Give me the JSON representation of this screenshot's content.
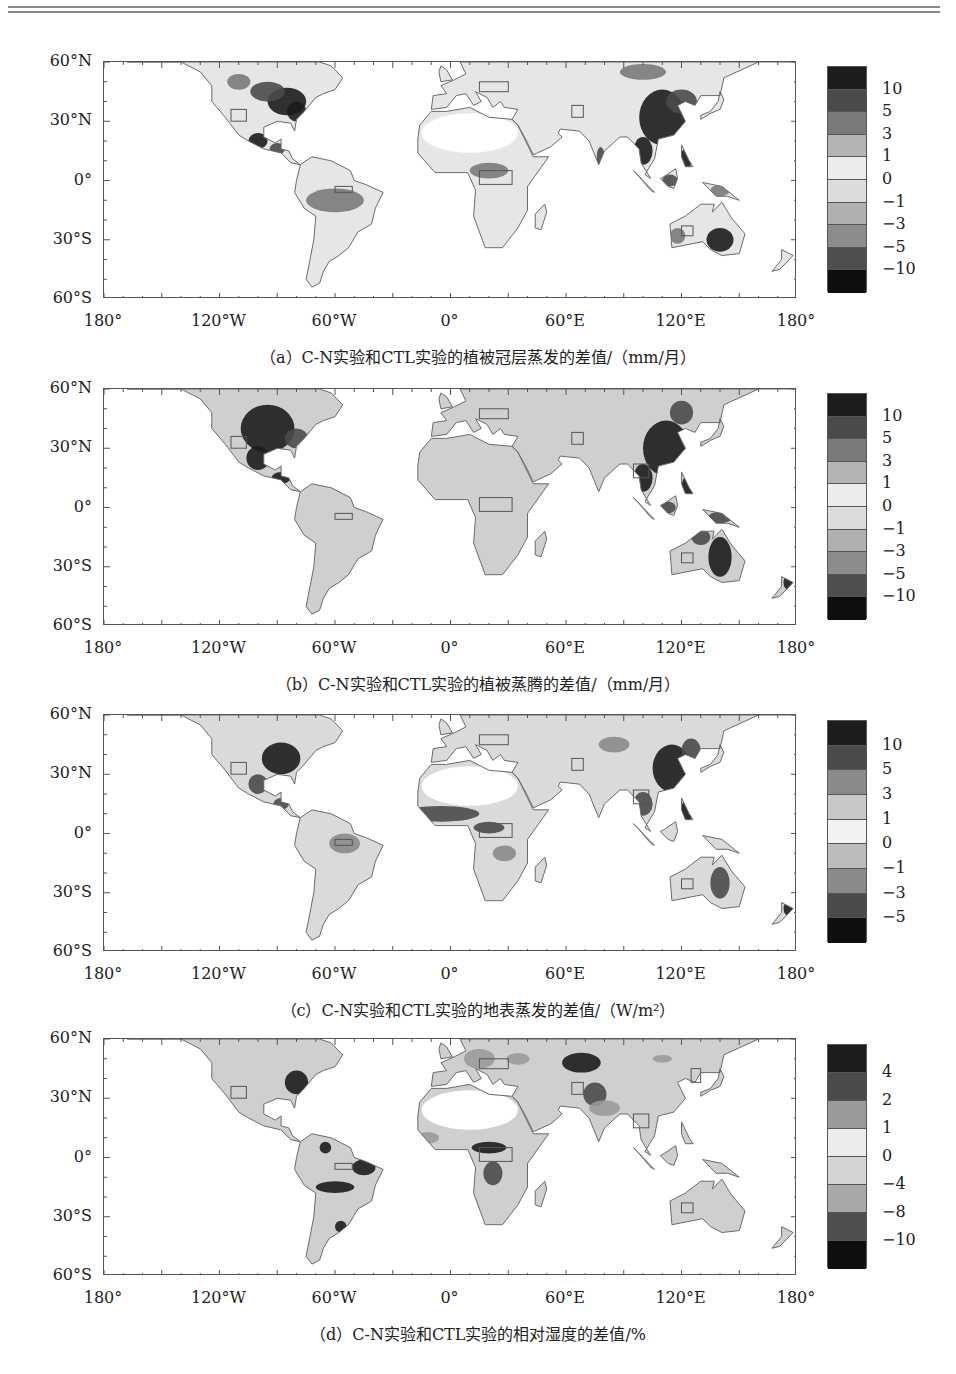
{
  "page": {
    "top_rule": true
  },
  "axes": {
    "y_ticks": [
      "60°N",
      "30°N",
      "0°",
      "30°S",
      "60°S"
    ],
    "x_ticks": [
      "180°",
      "120°W",
      "60°W",
      "0°",
      "60°E",
      "120°E",
      "180°"
    ]
  },
  "panels": [
    {
      "id": "a",
      "caption": "（a）C-N实验和CTL实验的植被冠层蒸发的差值/（mm/月）",
      "colorbar_labels": [
        "10",
        "5",
        "3",
        "1",
        "0",
        "−1",
        "−3",
        "−5",
        "−10"
      ],
      "colorbar_colors": [
        "#1c1c1c",
        "#4a4a4a",
        "#7a7a7a",
        "#b4b4b4",
        "#ececec",
        "#dcdcdc",
        "#b0b0b0",
        "#8c8c8c",
        "#4e4e4e",
        "#0e0e0e"
      ]
    },
    {
      "id": "b",
      "caption": "（b）C-N实验和CTL实验的植被蒸腾的差值/（mm/月）",
      "colorbar_labels": [
        "10",
        "5",
        "3",
        "1",
        "0",
        "−1",
        "−3",
        "−5",
        "−10"
      ],
      "colorbar_colors": [
        "#1c1c1c",
        "#4a4a4a",
        "#7a7a7a",
        "#b4b4b4",
        "#ececec",
        "#dcdcdc",
        "#b0b0b0",
        "#8c8c8c",
        "#4e4e4e",
        "#0e0e0e"
      ]
    },
    {
      "id": "c",
      "caption": "（c）C-N实验和CTL实验的地表蒸发的差值/（W/m²）",
      "colorbar_labels": [
        "10",
        "5",
        "3",
        "1",
        "0",
        "−1",
        "−3",
        "−5"
      ],
      "colorbar_colors": [
        "#1c1c1c",
        "#4a4a4a",
        "#8a8a8a",
        "#c8c8c8",
        "#f2f2f2",
        "#bcbcbc",
        "#8a8a8a",
        "#4a4a4a",
        "#0e0e0e"
      ]
    },
    {
      "id": "d",
      "caption": "（d）C-N实验和CTL实验的相对湿度的差值/%",
      "colorbar_labels": [
        "4",
        "2",
        "1",
        "0",
        "−4",
        "−8",
        "−10"
      ],
      "colorbar_colors": [
        "#1c1c1c",
        "#4a4a4a",
        "#9a9a9a",
        "#ececec",
        "#d4d4d4",
        "#a8a8a8",
        "#4e4e4e",
        "#0e0e0e"
      ]
    }
  ],
  "chart_data": [
    {
      "type": "heatmap",
      "title": "（a）C-N实验和CTL实验的植被冠层蒸发的差值/（mm/月）",
      "xlabel": "",
      "ylabel": "",
      "x_ticks": [
        "180°",
        "120°W",
        "60°W",
        "0°",
        "60°E",
        "120°E",
        "180°"
      ],
      "y_ticks": [
        "60°N",
        "30°N",
        "0°",
        "30°S",
        "60°S"
      ],
      "xlim": [
        -180,
        180
      ],
      "ylim": [
        -60,
        60
      ],
      "legend": {
        "type": "colorbar",
        "position": "right",
        "levels": [
          10,
          5,
          3,
          1,
          0,
          -1,
          -3,
          -5,
          -10
        ]
      },
      "notes": "Strong positive (dark) differences over eastern North America, Mexico/Central America, East/Southeast Asia and eastern Australia; light values elsewhere. Small rectangles mark study regions (SW USA, Amazon, Central Africa, Tibet, Europe, W Australia).",
      "grid": false
    },
    {
      "type": "heatmap",
      "title": "（b）C-N实验和CTL实验的植被蒸腾的差值/（mm/月）",
      "x_ticks": [
        "180°",
        "120°W",
        "60°W",
        "0°",
        "60°E",
        "120°E",
        "180°"
      ],
      "y_ticks": [
        "60°N",
        "30°N",
        "0°",
        "30°S",
        "60°S"
      ],
      "xlim": [
        -180,
        180
      ],
      "ylim": [
        -60,
        60
      ],
      "legend": {
        "type": "colorbar",
        "position": "right",
        "levels": [
          10,
          5,
          3,
          1,
          0,
          -1,
          -3,
          -5,
          -10
        ]
      },
      "notes": "Dark (large positive) over most of USA/Mexico, East Asia, Southeast Asia and eastern/northern Australia; light grey over South America, Africa, Europe.",
      "grid": false
    },
    {
      "type": "heatmap",
      "title": "（c）C-N实验和CTL实验的地表蒸发的差值/（W/m²）",
      "x_ticks": [
        "180°",
        "120°W",
        "60°W",
        "0°",
        "60°E",
        "120°E",
        "180°"
      ],
      "y_ticks": [
        "60°N",
        "30°N",
        "0°",
        "30°S",
        "60°S"
      ],
      "xlim": [
        -180,
        180
      ],
      "ylim": [
        -60,
        60
      ],
      "legend": {
        "type": "colorbar",
        "position": "right",
        "levels": [
          10,
          5,
          3,
          1,
          0,
          -1,
          -3,
          -5
        ]
      },
      "notes": "Dark bands over eastern USA, Sahel, East China, Southeast Asia and eastern Australia.",
      "grid": false
    },
    {
      "type": "heatmap",
      "title": "（d）C-N实验和CTL实验的相对湿度的差值/%",
      "x_ticks": [
        "180°",
        "120°W",
        "60°W",
        "0°",
        "60°E",
        "120°E",
        "180°"
      ],
      "y_ticks": [
        "60°N",
        "30°N",
        "0°",
        "30°S",
        "60°S"
      ],
      "xlim": [
        -180,
        180
      ],
      "ylim": [
        -60,
        60
      ],
      "legend": {
        "type": "colorbar",
        "position": "right",
        "levels": [
          4,
          2,
          1,
          0,
          -4,
          -8,
          -10
        ]
      },
      "notes": "Dark patches over eastern USA, Amazon basin, La Plata, Central Africa and Central Asia/Himalaya; mostly light grey elsewhere.",
      "grid": false
    }
  ]
}
